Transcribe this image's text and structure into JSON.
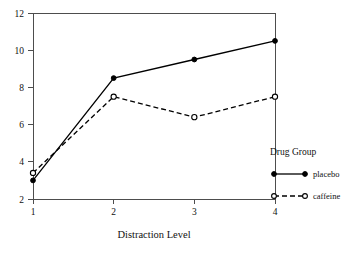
{
  "chart_data": {
    "type": "line",
    "title": "",
    "xlabel": "Distraction Level",
    "ylabel": "",
    "x": [
      1,
      2,
      3,
      4
    ],
    "categories": [
      "1",
      "2",
      "3",
      "4"
    ],
    "xticklabels": [
      "1",
      "2",
      "3",
      "4"
    ],
    "yticklabels": [
      "2",
      "4",
      "6",
      "8",
      "10",
      "12"
    ],
    "yticks": [
      2,
      4,
      6,
      8,
      10,
      12
    ],
    "xlim": [
      1,
      4
    ],
    "ylim": [
      2,
      12
    ],
    "grid": false,
    "legend_position": "right",
    "legend_title": "Drug Group",
    "series": [
      {
        "name": "placebo",
        "values": [
          3.0,
          8.5,
          9.5,
          10.5
        ],
        "linestyle": "solid",
        "marker": "filled-circle",
        "color": "#000000"
      },
      {
        "name": "caffeine",
        "values": [
          3.4,
          7.5,
          6.4,
          7.5
        ],
        "linestyle": "dashed",
        "marker": "open-circle",
        "color": "#000000"
      }
    ]
  },
  "axes": {
    "x_title": "Distraction Level",
    "x_tick_1": "1",
    "x_tick_2": "2",
    "x_tick_3": "3",
    "x_tick_4": "4",
    "y_tick_2": "2",
    "y_tick_4": "4",
    "y_tick_6": "6",
    "y_tick_8": "8",
    "y_tick_10": "10",
    "y_tick_12": "12"
  },
  "legend": {
    "title": "Drug Group",
    "entry_1": "placebo",
    "entry_2": "caffeine"
  },
  "colors": {
    "line": "#000000",
    "axis": "#4d4d4d",
    "background": "#ffffff"
  }
}
